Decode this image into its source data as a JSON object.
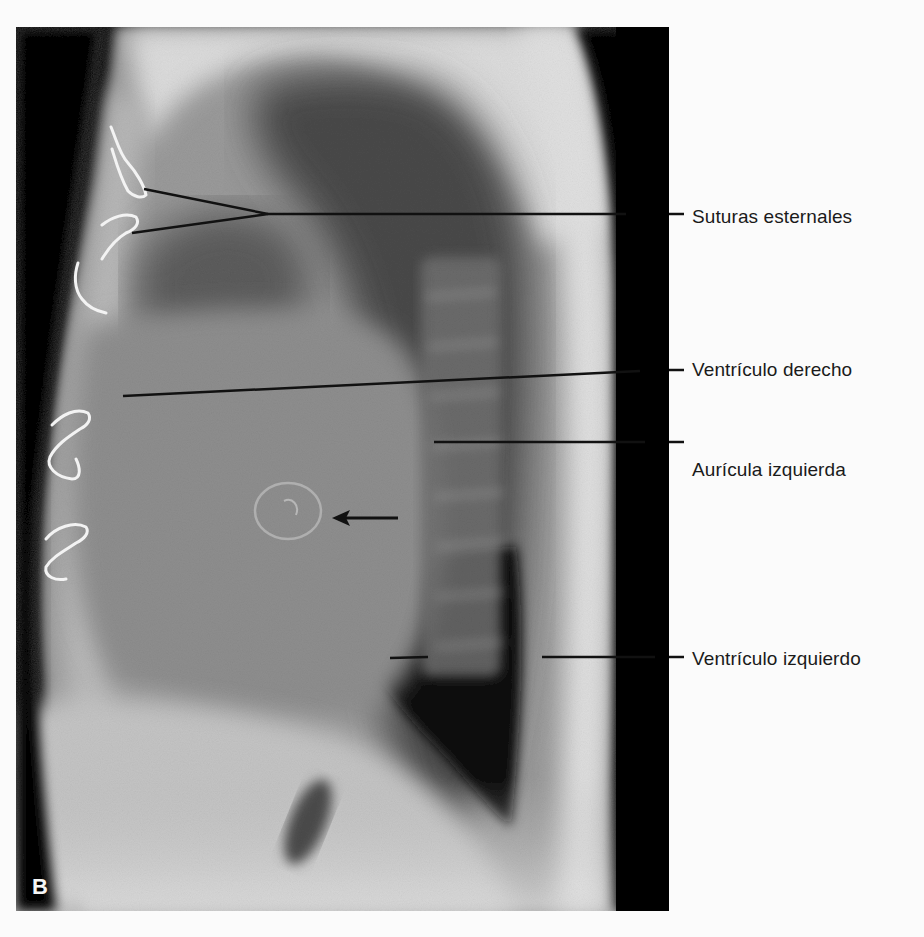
{
  "figure": {
    "panel_letter": "B",
    "colors": {
      "background": "#fbfbfb",
      "leader_line": "#111111",
      "label_text": "#1a1a1a",
      "panel_letter": "#f5f5f5"
    }
  },
  "labels": [
    {
      "id": "suturas",
      "text": "Suturas esternales",
      "y": 218
    },
    {
      "id": "ventriculo-derecho",
      "text": "Ventrículo derecho",
      "y": 370
    },
    {
      "id": "auricula-izquierda",
      "text": "Aurícula izquierda",
      "y": 470
    },
    {
      "id": "ventriculo-izquierdo",
      "text": "Ventrículo izquierdo",
      "y": 660
    }
  ],
  "arrow": {
    "direction": "left",
    "target": "valvular ring"
  }
}
